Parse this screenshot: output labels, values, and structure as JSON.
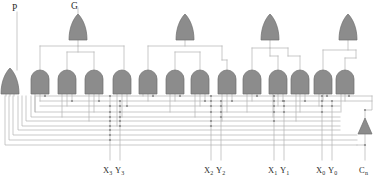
{
  "diagram": {
    "colors": {
      "gate_fill": "#8c8c8c",
      "gate_stroke": "#6e6e6e",
      "wire": "#b0b0b0",
      "junction": "#8a8a8a",
      "text": "#2b2b2b",
      "background": "#ffffff"
    }
  },
  "labels": {
    "top": [
      {
        "name": "P",
        "text": "P",
        "sub": "",
        "x": 14,
        "y": 5
      },
      {
        "name": "G",
        "text": "G",
        "sub": "",
        "x": 72,
        "y": 3
      }
    ],
    "bottom": [
      {
        "name": "x3y3",
        "text": "X",
        "sub": "3",
        "text2": "Y",
        "sub2": "3",
        "x": 104,
        "y": 167
      },
      {
        "name": "x2y2",
        "text": "X",
        "sub": "2",
        "text2": "Y",
        "sub2": "2",
        "x": 205,
        "y": 167
      },
      {
        "name": "x1y1",
        "text": "X",
        "sub": "1",
        "text2": "Y",
        "sub2": "1",
        "x": 269,
        "y": 167
      },
      {
        "name": "x0y0",
        "text": "X",
        "sub": "0",
        "text2": "Y",
        "sub2": "0",
        "x": 317,
        "y": 167
      },
      {
        "name": "cn",
        "text": "C",
        "sub": "n",
        "text2": "",
        "sub2": "",
        "x": 361,
        "y": 167
      }
    ]
  },
  "gates": {
    "or_top": [
      {
        "name": "or-gate-g3",
        "x": 78,
        "y": 16
      },
      {
        "name": "or-gate-g2",
        "x": 185,
        "y": 16
      },
      {
        "name": "or-gate-g1",
        "x": 270,
        "y": 16
      },
      {
        "name": "or-gate-g0",
        "x": 348,
        "y": 16
      }
    ],
    "or_bottom": [
      {
        "name": "or-gate-p",
        "x": 10,
        "y": 70
      }
    ],
    "and_row": [
      {
        "name": "and-gate-1",
        "x": 40,
        "y": 70
      },
      {
        "name": "and-gate-2",
        "x": 67,
        "y": 70
      },
      {
        "name": "and-gate-3",
        "x": 94,
        "y": 70
      },
      {
        "name": "and-gate-4",
        "x": 122,
        "y": 70
      },
      {
        "name": "and-gate-5",
        "x": 148,
        "y": 70
      },
      {
        "name": "and-gate-6",
        "x": 175,
        "y": 70
      },
      {
        "name": "and-gate-7",
        "x": 200,
        "y": 70
      },
      {
        "name": "and-gate-8",
        "x": 227,
        "y": 70
      },
      {
        "name": "and-gate-9",
        "x": 252,
        "y": 70
      },
      {
        "name": "and-gate-10",
        "x": 278,
        "y": 70
      },
      {
        "name": "and-gate-11",
        "x": 300,
        "y": 70
      },
      {
        "name": "and-gate-12",
        "x": 323,
        "y": 70
      },
      {
        "name": "and-gate-13",
        "x": 345,
        "y": 70
      }
    ],
    "buffer": [
      {
        "name": "buffer-cn",
        "x": 365,
        "y": 118
      }
    ]
  },
  "bus_lines": {
    "count": 10,
    "y_values": [
      96,
      101,
      106,
      111,
      116,
      121,
      126,
      131,
      138,
      147
    ]
  },
  "input_columns": [
    {
      "name": "col-x3",
      "x": 110
    },
    {
      "name": "col-y3",
      "x": 120
    },
    {
      "name": "col-x2",
      "x": 211
    },
    {
      "name": "col-y2",
      "x": 221
    },
    {
      "name": "col-x1",
      "x": 274
    },
    {
      "name": "col-y1",
      "x": 284
    },
    {
      "name": "col-x0",
      "x": 322
    },
    {
      "name": "col-y0",
      "x": 332
    },
    {
      "name": "col-cn",
      "x": 365
    }
  ]
}
